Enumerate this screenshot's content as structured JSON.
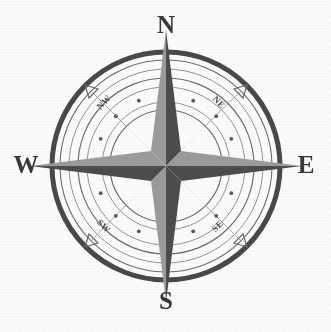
{
  "figure": {
    "kind": "compass-rose",
    "background_color": "#fdfdfd",
    "ink_color": "#3a3a3a",
    "canvas": {
      "width": 331,
      "height": 332
    },
    "center": {
      "x": 166,
      "y": 166
    }
  },
  "cardinals": [
    {
      "id": "n",
      "label": "N",
      "bearing_deg": 0
    },
    {
      "id": "e",
      "label": "E",
      "bearing_deg": 90
    },
    {
      "id": "s",
      "label": "S",
      "bearing_deg": 180
    },
    {
      "id": "w",
      "label": "W",
      "bearing_deg": 270
    }
  ],
  "ordinals": [
    {
      "id": "ne",
      "label": "NE",
      "bearing_deg": 45
    },
    {
      "id": "se",
      "label": "SE",
      "bearing_deg": 135
    },
    {
      "id": "sw",
      "label": "SW",
      "bearing_deg": 225
    },
    {
      "id": "nw",
      "label": "NW",
      "bearing_deg": 315
    }
  ],
  "rings": [
    {
      "id": "outer-heavy",
      "radius": 114,
      "stroke_width": 5.0,
      "color": "#4a4a4a",
      "style": "solid"
    },
    {
      "id": "outer-thin",
      "radius": 106,
      "stroke_width": 1.1,
      "color": "#6e6e6e",
      "style": "solid"
    },
    {
      "id": "label-ring",
      "radius": 97,
      "stroke_width": 1.0,
      "color": "#8a8a8a",
      "style": "solid"
    },
    {
      "id": "mid-ring",
      "radius": 88,
      "stroke_width": 1.2,
      "color": "#6e6e6e",
      "style": "solid"
    },
    {
      "id": "dot-ring-out",
      "radius": 79,
      "stroke_width": 1.0,
      "color": "#8a8a8a",
      "style": "solid"
    },
    {
      "id": "dot-ring-in",
      "radius": 64,
      "stroke_width": 1.0,
      "color": "#8a8a8a",
      "style": "solid"
    },
    {
      "id": "inner-ring",
      "radius": 56,
      "stroke_width": 1.2,
      "color": "#6e6e6e",
      "style": "solid"
    }
  ],
  "dot_ring": {
    "radius": 71,
    "dot_count": 16,
    "dot_radius": 1.8,
    "color": "#5a5a5a"
  },
  "star": {
    "point_count": 8,
    "major_points": {
      "ids": [
        "n",
        "e",
        "s",
        "w"
      ],
      "tip_radius": 136,
      "half_width": 15,
      "light_color": "#9a9a9a",
      "dark_color": "#4e4e4e"
    },
    "minor_points": {
      "ids": [
        "ne",
        "se",
        "sw",
        "nw"
      ],
      "tip_radius": 93,
      "half_width": 13,
      "light_color": "#9a9a9a",
      "dark_color": "#4e4e4e"
    }
  },
  "tick_markers": {
    "description": "small open triangular arrowheads on the outer ring at the four ordinal bearings",
    "bearings_deg": [
      45,
      135,
      225,
      315
    ],
    "radius": 114,
    "size": 9,
    "color": "#6a6a6a"
  },
  "spokes": {
    "count": 8,
    "inner_radius": 56,
    "outer_radius": 106,
    "color": "#8a8a8a",
    "stroke_width": 0.8
  }
}
